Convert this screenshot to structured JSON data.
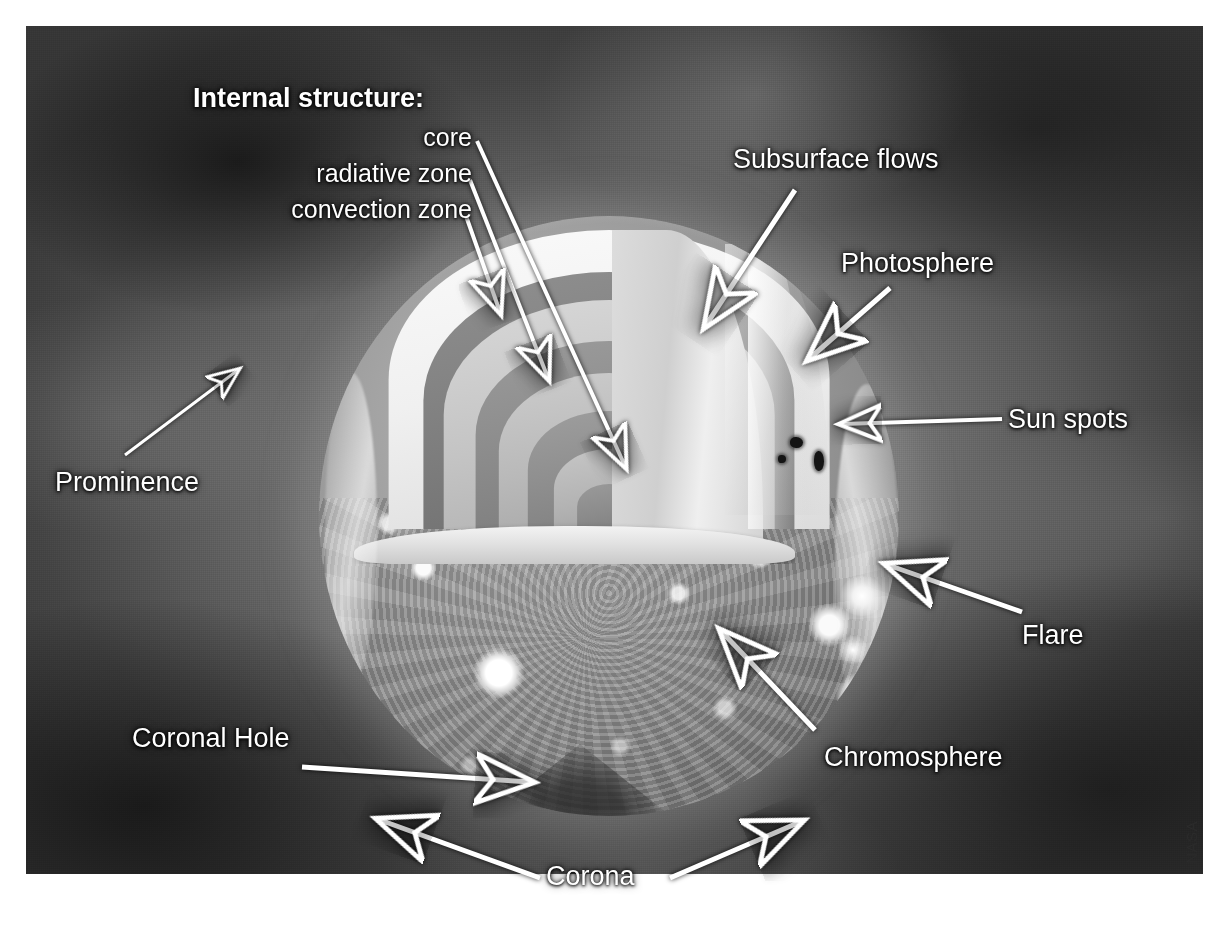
{
  "figure": {
    "title_label": "Internal structure:",
    "credit": "NASA"
  },
  "internal_structure": {
    "heading": "Internal structure:",
    "items": [
      {
        "label": "core"
      },
      {
        "label": "radiative zone"
      },
      {
        "label": "convection zone"
      }
    ]
  },
  "annotations": [
    {
      "label": "Subsurface flows"
    },
    {
      "label": "Photosphere"
    },
    {
      "label": "Sun spots"
    },
    {
      "label": "Flare"
    },
    {
      "label": "Chromosphere"
    },
    {
      "label": "Corona"
    },
    {
      "label": "Coronal Hole"
    },
    {
      "label": "Prominence"
    }
  ],
  "labels": {
    "subsurface_flows": "Subsurface flows",
    "photosphere": "Photosphere",
    "sun_spots": "Sun spots",
    "flare": "Flare",
    "chromosphere": "Chromosphere",
    "corona": "Corona",
    "coronal_hole": "Coronal Hole",
    "prominence": "Prominence",
    "core": "core",
    "radiative_zone": "radiative zone",
    "convection_zone": "convection zone"
  },
  "colors": {
    "label_text": "#ffffff",
    "arrow": "#ffffff",
    "plate_background": "#4a4a4a",
    "page_background": "#ffffff",
    "sunspot": "#141414"
  }
}
